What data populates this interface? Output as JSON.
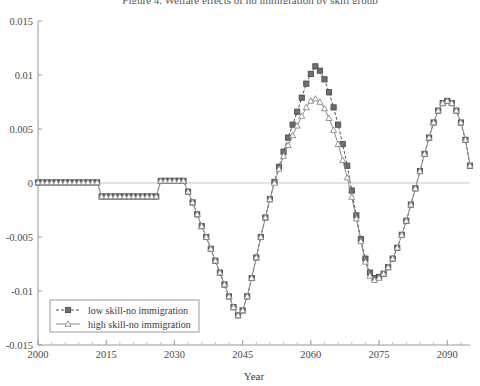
{
  "chart_data": {
    "type": "line",
    "title": "Figure 4. Welfare effects of no immigration by skill group",
    "xlabel": "Year",
    "ylabel": "",
    "xlim": [
      2000,
      2095
    ],
    "ylim": [
      -0.015,
      0.015
    ],
    "xticks": [
      2000,
      2015,
      2030,
      2045,
      2060,
      2075,
      2090
    ],
    "yticks": [
      -0.015,
      -0.01,
      -0.005,
      0,
      0.005,
      0.01,
      0.015
    ],
    "ytick_labels": [
      "-0.015",
      "-0.01",
      "-0.005",
      "0",
      "0.005",
      "0.01",
      "0.015"
    ],
    "xtick_labels": [
      "2000",
      "2015",
      "2030",
      "2045",
      "2060",
      "2075",
      "2090"
    ],
    "grid": false,
    "zero_line": true,
    "legend_position": "lower-left",
    "series": [
      {
        "name": "low skill-no immigration",
        "marker": "filled-square",
        "line_style": "dashed",
        "color": "#4d4d4d",
        "x": [
          2000,
          2001,
          2002,
          2003,
          2004,
          2005,
          2006,
          2007,
          2008,
          2009,
          2010,
          2011,
          2012,
          2013,
          2014,
          2015,
          2016,
          2017,
          2018,
          2019,
          2020,
          2021,
          2022,
          2023,
          2024,
          2025,
          2026,
          2027,
          2028,
          2029,
          2030,
          2031,
          2032,
          2033,
          2034,
          2035,
          2036,
          2037,
          2038,
          2039,
          2040,
          2041,
          2042,
          2043,
          2044,
          2045,
          2046,
          2047,
          2048,
          2049,
          2050,
          2051,
          2052,
          2053,
          2054,
          2055,
          2056,
          2057,
          2058,
          2059,
          2060,
          2061,
          2062,
          2063,
          2064,
          2065,
          2066,
          2067,
          2068,
          2069,
          2070,
          2071,
          2072,
          2073,
          2074,
          2075,
          2076,
          2077,
          2078,
          2079,
          2080,
          2081,
          2082,
          2083,
          2084,
          2085,
          2086,
          2087,
          2088,
          2089,
          2090,
          2091,
          2092,
          2093,
          2094,
          2095
        ],
        "values": [
          5e-05,
          5e-05,
          5e-05,
          5e-05,
          5e-05,
          5e-05,
          5e-05,
          5e-05,
          5e-05,
          5e-05,
          5e-05,
          5e-05,
          5e-05,
          5e-05,
          -0.00125,
          -0.00125,
          -0.00125,
          -0.00125,
          -0.00125,
          -0.00125,
          -0.00125,
          -0.00125,
          -0.00125,
          -0.00125,
          -0.00125,
          -0.00125,
          -0.00125,
          0.0002,
          0.0002,
          0.0002,
          0.0002,
          0.0002,
          0.0002,
          -0.0008,
          -0.0018,
          -0.0029,
          -0.004,
          -0.005,
          -0.0061,
          -0.0072,
          -0.0083,
          -0.0094,
          -0.0105,
          -0.0115,
          -0.01225,
          -0.0118,
          -0.0105,
          -0.0088,
          -0.0069,
          -0.005,
          -0.0032,
          -0.0015,
          0.0001,
          0.0015,
          0.0029,
          0.0042,
          0.0054,
          0.0066,
          0.0079,
          0.0092,
          0.0101,
          0.0108,
          0.0104,
          0.0096,
          0.0084,
          0.007,
          0.0054,
          0.0036,
          0.0016,
          -0.0007,
          -0.003,
          -0.0052,
          -0.007,
          -0.0083,
          -0.0088,
          -0.0087,
          -0.0084,
          -0.0078,
          -0.007,
          -0.006,
          -0.0048,
          -0.0035,
          -0.002,
          -0.0005,
          0.0011,
          0.0027,
          0.0042,
          0.0056,
          0.0067,
          0.0074,
          0.0076,
          0.0074,
          0.0067,
          0.0056,
          0.004,
          0.0016
        ]
      },
      {
        "name": "high skill-no immigration",
        "marker": "open-triangle",
        "line_style": "solid",
        "color": "#8a8a8a",
        "x": [
          2000,
          2001,
          2002,
          2003,
          2004,
          2005,
          2006,
          2007,
          2008,
          2009,
          2010,
          2011,
          2012,
          2013,
          2014,
          2015,
          2016,
          2017,
          2018,
          2019,
          2020,
          2021,
          2022,
          2023,
          2024,
          2025,
          2026,
          2027,
          2028,
          2029,
          2030,
          2031,
          2032,
          2033,
          2034,
          2035,
          2036,
          2037,
          2038,
          2039,
          2040,
          2041,
          2042,
          2043,
          2044,
          2045,
          2046,
          2047,
          2048,
          2049,
          2050,
          2051,
          2052,
          2053,
          2054,
          2055,
          2056,
          2057,
          2058,
          2059,
          2060,
          2061,
          2062,
          2063,
          2064,
          2065,
          2066,
          2067,
          2068,
          2069,
          2070,
          2071,
          2072,
          2073,
          2074,
          2075,
          2076,
          2077,
          2078,
          2079,
          2080,
          2081,
          2082,
          2083,
          2084,
          2085,
          2086,
          2087,
          2088,
          2089,
          2090,
          2091,
          2092,
          2093,
          2094,
          2095
        ],
        "values": [
          5e-05,
          5e-05,
          5e-05,
          5e-05,
          5e-05,
          5e-05,
          5e-05,
          5e-05,
          5e-05,
          5e-05,
          5e-05,
          5e-05,
          5e-05,
          5e-05,
          -0.00125,
          -0.00125,
          -0.00125,
          -0.00125,
          -0.00125,
          -0.00125,
          -0.00125,
          -0.00125,
          -0.00125,
          -0.00125,
          -0.00125,
          -0.00125,
          -0.00125,
          0.0002,
          0.0002,
          0.0002,
          0.0002,
          0.0002,
          0.0002,
          -0.0008,
          -0.0018,
          -0.0029,
          -0.004,
          -0.005,
          -0.0061,
          -0.0072,
          -0.0083,
          -0.0094,
          -0.0105,
          -0.0115,
          -0.01225,
          -0.0118,
          -0.0105,
          -0.0088,
          -0.0069,
          -0.005,
          -0.0032,
          -0.0015,
          0.0,
          0.0013,
          0.0025,
          0.0035,
          0.0044,
          0.0053,
          0.0062,
          0.007,
          0.0076,
          0.0078,
          0.0075,
          0.0069,
          0.006,
          0.0049,
          0.0036,
          0.0021,
          0.0005,
          -0.0013,
          -0.0033,
          -0.0054,
          -0.0073,
          -0.0086,
          -0.009,
          -0.0088,
          -0.0084,
          -0.0078,
          -0.007,
          -0.006,
          -0.0048,
          -0.0035,
          -0.002,
          -0.0005,
          0.0011,
          0.0027,
          0.0042,
          0.0056,
          0.0067,
          0.0074,
          0.0076,
          0.0074,
          0.0067,
          0.0056,
          0.004,
          0.0016
        ]
      }
    ]
  },
  "legend": {
    "entries": [
      {
        "label": "low skill-no immigration"
      },
      {
        "label": "high skill-no immigration"
      }
    ]
  }
}
